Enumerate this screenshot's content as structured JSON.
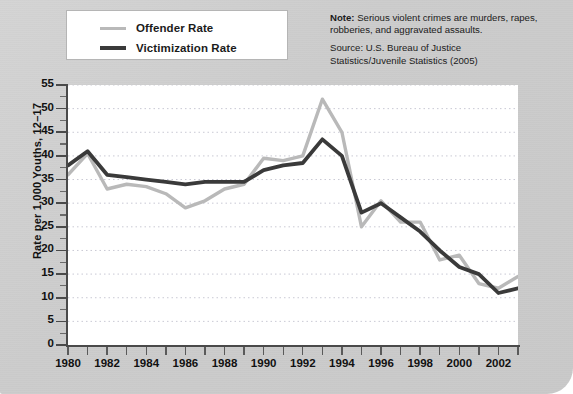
{
  "legend": {
    "items": [
      {
        "label": "Offender Rate",
        "color": "#b9b9b9",
        "key": "offender"
      },
      {
        "label": "Victimization Rate",
        "color": "#3a3a3a",
        "key": "victimization"
      }
    ]
  },
  "note": {
    "note_strong": "Note:",
    "note_text": " Serious violent crimes are murders, rapes, robberies, and aggravated assaults.",
    "source_line1": "Source: U.S. Bureau of Justice",
    "source_line2": "Statistics/Juvenile Statistics (2005)"
  },
  "axes": {
    "ylabel": "Rate per 1,000 Youths, 12–17",
    "yticks": [
      0,
      5,
      10,
      15,
      20,
      25,
      30,
      35,
      40,
      45,
      50,
      55
    ],
    "xticklabels": [
      "1980",
      "1982",
      "1984",
      "1986",
      "1988",
      "1990",
      "1992",
      "1994",
      "1996",
      "1998",
      "2000",
      "2002"
    ]
  },
  "chart_data": {
    "type": "line",
    "title": "",
    "xlabel": "",
    "ylabel": "Rate per 1,000 Youths, 12–17",
    "ylim": [
      0,
      55
    ],
    "xlim": [
      1980,
      2003
    ],
    "grid": true,
    "grid_axis": "y",
    "legend_position": "top-left",
    "x": [
      1980,
      1981,
      1982,
      1983,
      1984,
      1985,
      1986,
      1987,
      1988,
      1989,
      1990,
      1991,
      1992,
      1993,
      1994,
      1995,
      1996,
      1997,
      1998,
      1999,
      2000,
      2001,
      2002,
      2003
    ],
    "series": [
      {
        "name": "Offender Rate",
        "color": "#b9b9b9",
        "values": [
          36.0,
          40.5,
          33.0,
          34.0,
          33.5,
          32.0,
          29.0,
          30.5,
          33.0,
          34.0,
          39.5,
          39.0,
          40.0,
          52.0,
          45.0,
          25.0,
          30.5,
          26.0,
          26.0,
          18.0,
          19.0,
          13.0,
          12.0,
          14.5
        ]
      },
      {
        "name": "Victimization Rate",
        "color": "#3a3a3a",
        "values": [
          38.0,
          41.0,
          36.0,
          35.5,
          35.0,
          34.5,
          34.0,
          34.5,
          34.5,
          34.5,
          37.0,
          38.0,
          38.5,
          43.5,
          40.0,
          28.0,
          30.0,
          27.0,
          24.0,
          20.0,
          16.5,
          15.0,
          11.0,
          12.0
        ]
      }
    ]
  }
}
